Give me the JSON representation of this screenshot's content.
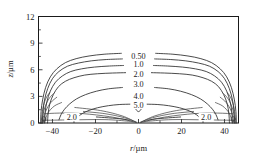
{
  "chart_data": {
    "type": "line",
    "subtype": "contour",
    "title": "",
    "xlabel": "r/µm",
    "ylabel": "z/µm",
    "xlabel_var": "r",
    "xlabel_unit": "/µm",
    "ylabel_var": "z",
    "ylabel_unit": "/µm",
    "xlim": [
      -46.5,
      46.5
    ],
    "ylim": [
      0,
      12
    ],
    "xticks": [
      -40,
      -20,
      0,
      20,
      40
    ],
    "xticklabels": [
      "−40",
      "−20",
      "0",
      "20",
      "40"
    ],
    "yticks": [
      0,
      3,
      6,
      9,
      12
    ],
    "yticklabels": [
      "0",
      "3",
      "6",
      "9",
      "12"
    ],
    "x_minor_ticks": [
      -30,
      -10,
      10,
      30
    ],
    "y_minor_ticks": [
      1.5,
      4.5,
      7.5,
      10.5
    ],
    "grid": false,
    "legend": null,
    "frame": true,
    "tick_direction": "in",
    "line_color": "#2b2b2b",
    "background": "#ffffff",
    "levels": [
      0.5,
      1.0,
      2.0,
      3.0,
      4.0,
      5.0
    ],
    "contour_labels": [
      {
        "text": "0.50",
        "x": 0.0,
        "y": 7.55
      },
      {
        "text": "1.0",
        "x": 0.0,
        "y": 6.6
      },
      {
        "text": "2.0",
        "x": 0.0,
        "y": 5.45
      },
      {
        "text": "3.0",
        "x": 0.0,
        "y": 4.35
      },
      {
        "text": "4.0",
        "x": 0.0,
        "y": 2.95
      },
      {
        "text": "5.0",
        "x": 0.0,
        "y": 2.0
      },
      {
        "text": "2.0",
        "x": -31.0,
        "y": 0.62
      },
      {
        "text": "2.0",
        "x": 31.5,
        "y": 0.62
      }
    ],
    "contours": [
      {
        "level": 0.5,
        "label": "0.50",
        "points": [
          [
            -45.5,
            0.0
          ],
          [
            -45.3,
            1.3
          ],
          [
            -44.6,
            2.6
          ],
          [
            -43.2,
            4.0
          ],
          [
            -41.0,
            5.2
          ],
          [
            -38.0,
            6.1
          ],
          [
            -34.0,
            6.8
          ],
          [
            -29.0,
            7.25
          ],
          [
            -23.0,
            7.55
          ],
          [
            -16.0,
            7.75
          ],
          [
            -8.0,
            7.85
          ],
          [
            0.0,
            7.88
          ],
          [
            8.0,
            7.85
          ],
          [
            16.0,
            7.75
          ],
          [
            23.0,
            7.55
          ],
          [
            29.0,
            7.25
          ],
          [
            34.0,
            6.8
          ],
          [
            38.0,
            6.1
          ],
          [
            41.0,
            5.2
          ],
          [
            43.2,
            4.0
          ],
          [
            44.6,
            2.6
          ],
          [
            45.3,
            1.3
          ],
          [
            45.5,
            0.0
          ]
        ]
      },
      {
        "level": 1.0,
        "label": "1.0",
        "points": [
          [
            -44.6,
            0.0
          ],
          [
            -44.4,
            1.3
          ],
          [
            -43.7,
            2.6
          ],
          [
            -42.2,
            3.9
          ],
          [
            -40.0,
            5.0
          ],
          [
            -37.0,
            5.8
          ],
          [
            -33.0,
            6.4
          ],
          [
            -28.0,
            6.75
          ],
          [
            -22.0,
            7.0
          ],
          [
            -15.0,
            7.15
          ],
          [
            -7.5,
            7.22
          ],
          [
            0.0,
            7.25
          ],
          [
            7.5,
            7.22
          ],
          [
            15.0,
            7.15
          ],
          [
            22.0,
            7.0
          ],
          [
            28.0,
            6.75
          ],
          [
            33.0,
            6.4
          ],
          [
            37.0,
            5.8
          ],
          [
            40.0,
            5.0
          ],
          [
            42.2,
            3.9
          ],
          [
            43.7,
            2.6
          ],
          [
            44.4,
            1.3
          ],
          [
            44.6,
            0.0
          ]
        ]
      },
      {
        "level": 2.0,
        "label": "2.0",
        "points": [
          [
            -43.6,
            0.0
          ],
          [
            -43.4,
            1.2
          ],
          [
            -42.6,
            2.4
          ],
          [
            -41.0,
            3.6
          ],
          [
            -38.6,
            4.6
          ],
          [
            -35.4,
            5.3
          ],
          [
            -31.5,
            5.8
          ],
          [
            -26.5,
            6.1
          ],
          [
            -20.5,
            6.3
          ],
          [
            -13.5,
            6.42
          ],
          [
            -7.0,
            6.48
          ],
          [
            0.0,
            6.5
          ],
          [
            7.0,
            6.48
          ],
          [
            13.5,
            6.42
          ],
          [
            20.5,
            6.3
          ],
          [
            26.5,
            6.1
          ],
          [
            31.5,
            5.8
          ],
          [
            35.4,
            5.3
          ],
          [
            38.6,
            4.6
          ],
          [
            41.0,
            3.6
          ],
          [
            42.6,
            2.4
          ],
          [
            43.4,
            1.2
          ],
          [
            43.6,
            0.0
          ]
        ]
      },
      {
        "level": 3.0,
        "label": "3.0",
        "points": [
          [
            -42.3,
            0.0
          ],
          [
            -42.0,
            1.1
          ],
          [
            -41.2,
            2.2
          ],
          [
            -39.6,
            3.2
          ],
          [
            -37.2,
            4.1
          ],
          [
            -34.0,
            4.7
          ],
          [
            -30.0,
            5.1
          ],
          [
            -25.0,
            5.4
          ],
          [
            -19.0,
            5.55
          ],
          [
            -12.0,
            5.63
          ],
          [
            -6.0,
            5.67
          ],
          [
            0.0,
            5.68
          ],
          [
            6.0,
            5.67
          ],
          [
            12.0,
            5.63
          ],
          [
            19.0,
            5.55
          ],
          [
            25.0,
            5.4
          ],
          [
            30.0,
            5.1
          ],
          [
            34.0,
            4.7
          ],
          [
            37.2,
            4.1
          ],
          [
            39.6,
            3.2
          ],
          [
            41.2,
            2.2
          ],
          [
            42.0,
            1.1
          ],
          [
            42.3,
            0.0
          ]
        ]
      },
      {
        "level": 4.0,
        "label": "4.0",
        "points": [
          [
            -37.0,
            0.35
          ],
          [
            -36.0,
            0.95
          ],
          [
            -34.4,
            1.55
          ],
          [
            -32.0,
            2.15
          ],
          [
            -28.8,
            2.72
          ],
          [
            -24.6,
            3.2
          ],
          [
            -19.6,
            3.58
          ],
          [
            -14.0,
            3.85
          ],
          [
            -7.5,
            4.0
          ],
          [
            0.0,
            4.06
          ],
          [
            7.5,
            4.0
          ],
          [
            14.0,
            3.85
          ],
          [
            19.6,
            3.58
          ],
          [
            24.6,
            3.2
          ],
          [
            28.8,
            2.72
          ],
          [
            32.0,
            2.15
          ],
          [
            34.4,
            1.55
          ],
          [
            36.0,
            0.95
          ],
          [
            37.0,
            0.35
          ]
        ]
      },
      {
        "level": 5.0,
        "label": "5.0",
        "points": [
          [
            -29.0,
            0.38
          ],
          [
            -28.0,
            0.72
          ],
          [
            -26.0,
            1.08
          ],
          [
            -23.0,
            1.42
          ],
          [
            -19.0,
            1.72
          ],
          [
            -14.0,
            1.95
          ],
          [
            -9.0,
            2.08
          ],
          [
            -4.0,
            2.12
          ],
          [
            0.0,
            2.12
          ],
          [
            4.0,
            2.12
          ],
          [
            9.0,
            2.08
          ],
          [
            14.0,
            1.95
          ],
          [
            19.0,
            1.72
          ],
          [
            23.0,
            1.42
          ],
          [
            26.0,
            1.08
          ],
          [
            28.0,
            0.72
          ],
          [
            29.0,
            0.38
          ]
        ]
      }
    ]
  }
}
